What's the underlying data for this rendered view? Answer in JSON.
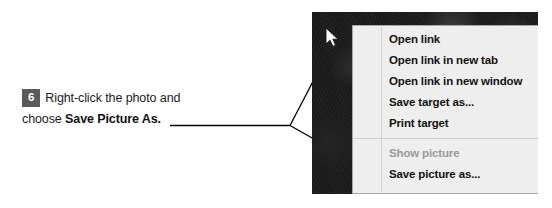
{
  "callout": {
    "step_number": "6",
    "line1_text": "Right-click the photo and",
    "line2_prefix": "choose ",
    "line2_bold": "Save Picture As.",
    "badge_color": "#5b5b5b",
    "text_color": "#1c1c1c"
  },
  "screenshot": {
    "photo_label": "dark-photo",
    "cursor_label": "mouse-pointer",
    "background_color": "#191919"
  },
  "context_menu": {
    "background_color": "#eeeeee",
    "border_color": "#a6a6a6",
    "disabled_color": "#9a9a9a",
    "items": [
      {
        "label": "Open link",
        "disabled": false
      },
      {
        "label": "Open link in new tab",
        "disabled": false
      },
      {
        "label": "Open link in new window",
        "disabled": false
      },
      {
        "label": "Save target as...",
        "disabled": false
      },
      {
        "label": "Print target",
        "disabled": false
      },
      {
        "label": "Show picture",
        "disabled": true
      },
      {
        "label": "Save picture as...",
        "disabled": false
      }
    ]
  }
}
